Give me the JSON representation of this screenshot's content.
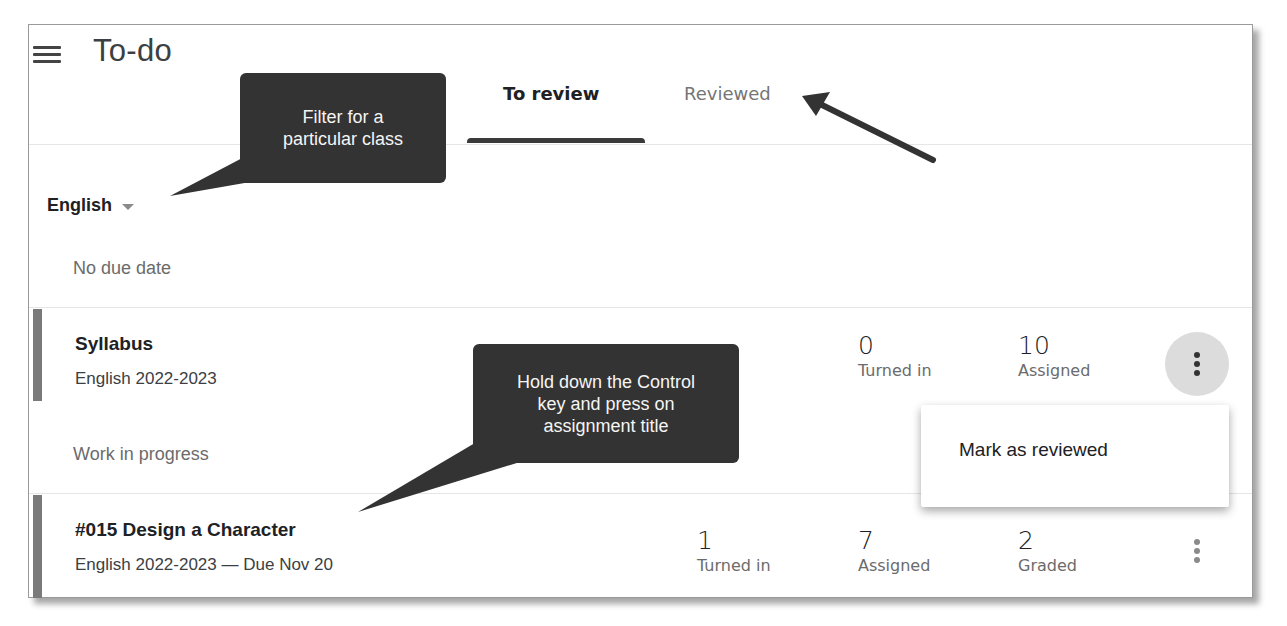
{
  "header": {
    "menu_icon": "hamburger-menu-icon",
    "title": "To-do"
  },
  "tabs": [
    {
      "label": "To review",
      "active": true
    },
    {
      "label": "Reviewed",
      "active": false
    }
  ],
  "class_filter": {
    "selected": "English",
    "icon": "dropdown-caret-icon"
  },
  "sections": [
    {
      "label": "No due date",
      "items": [
        {
          "title": "Syllabus",
          "subtitle": "English 2022-2023",
          "stats": [
            {
              "value": "0",
              "label": "Turned in"
            },
            {
              "value": "10",
              "label": "Assigned"
            }
          ],
          "more_icon": "more-vert-icon"
        }
      ]
    },
    {
      "label": "Work in progress",
      "items": [
        {
          "title": "#015 Design a Character",
          "subtitle": "English 2022-2023 — Due Nov 20",
          "stats": [
            {
              "value": "1",
              "label": "Turned in"
            },
            {
              "value": "7",
              "label": "Assigned"
            },
            {
              "value": "2",
              "label": "Graded"
            }
          ],
          "more_icon": "more-vert-icon"
        }
      ]
    }
  ],
  "menu": {
    "items": [
      {
        "label": "Mark as reviewed"
      }
    ]
  },
  "callouts": [
    {
      "text": "Filter for a\nparticular class"
    },
    {
      "text": "Hold down the Control\nkey and press on\nassignment title"
    }
  ],
  "colors": {
    "callout_bg": "#333333",
    "row_bar": "#7a7a7a",
    "tab_underline": "#3a3a3a",
    "more_button_active_bg": "#dcdcdc"
  }
}
